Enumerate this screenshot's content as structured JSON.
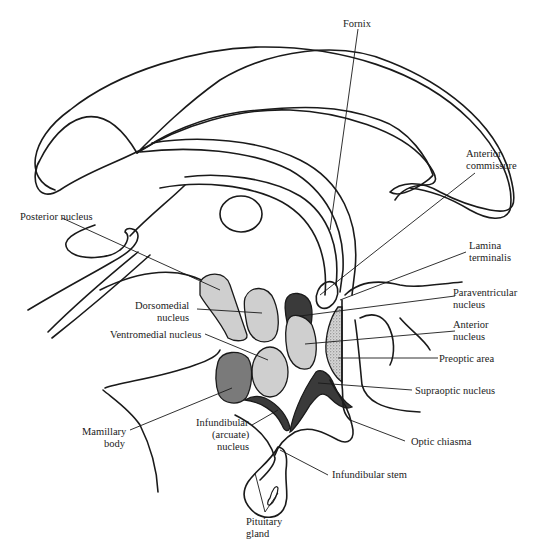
{
  "diagram": {
    "colors": {
      "light_nucleus": "#cfcfcf",
      "medium_nucleus": "#7a7a7a",
      "dark_nucleus": "#3a3a3a",
      "preoptic_stipple": "#a8a8a8",
      "outline": "#1a1a1a",
      "background": "#ffffff"
    },
    "labels": {
      "fornix": "Fornix",
      "anterior_commissure_1": "Anterior",
      "anterior_commissure_2": "commissure",
      "posterior_nucleus": "Posterior nucleus",
      "lamina_terminalis_1": "Lamina",
      "lamina_terminalis_2": "terminalis",
      "dorsomedial_1": "Dorsomedial",
      "dorsomedial_2": "nucleus",
      "paraventricular_1": "Paraventricular",
      "paraventricular_2": "nucleus",
      "ventromedial": "Ventromedial nucleus",
      "anterior_nucleus_1": "Anterior",
      "anterior_nucleus_2": "nucleus",
      "preoptic_area": "Preoptic area",
      "supraoptic_nucleus": "Supraoptic nucleus",
      "mamillary_1": "Mamillary",
      "mamillary_2": "body",
      "infundibular_1": "Infundibular",
      "infundibular_2": "(arcuate)",
      "infundibular_3": "nucleus",
      "optic_chiasma": "Optic chiasma",
      "infundibular_stem": "Infundibular stem",
      "pituitary_1": "Pituitary",
      "pituitary_2": "gland"
    },
    "structures": [
      {
        "name": "Posterior nucleus",
        "shade": "light"
      },
      {
        "name": "Dorsomedial nucleus",
        "shade": "light"
      },
      {
        "name": "Paraventricular nucleus",
        "shade": "dark"
      },
      {
        "name": "Ventromedial nucleus",
        "shade": "light"
      },
      {
        "name": "Anterior nucleus",
        "shade": "light"
      },
      {
        "name": "Preoptic area",
        "shade": "stippled"
      },
      {
        "name": "Supraoptic nucleus",
        "shade": "dark"
      },
      {
        "name": "Mamillary body",
        "shade": "medium"
      },
      {
        "name": "Infundibular (arcuate) nucleus",
        "shade": "dark"
      }
    ]
  }
}
